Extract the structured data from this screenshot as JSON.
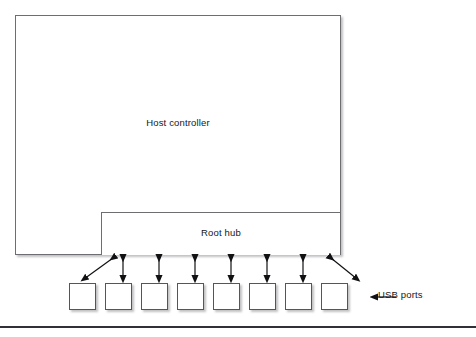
{
  "figure": {
    "type": "block-diagram",
    "background_color": "#ffffff",
    "line_color": "#6e6e72",
    "text_color": "#161616"
  },
  "blocks": {
    "host_controller": {
      "label": "Host controller",
      "x": 15,
      "y": 15,
      "width": 326,
      "height": 240
    },
    "root_hub": {
      "label": "Root hub",
      "x": 101,
      "y": 212,
      "width": 240,
      "height": 43
    }
  },
  "ports": {
    "count": 8,
    "callout_label": "USB ports",
    "callout_icon": "arrow-left-icon",
    "items": [
      {
        "index": 1,
        "label": ""
      },
      {
        "index": 2,
        "label": ""
      },
      {
        "index": 3,
        "label": ""
      },
      {
        "index": 4,
        "label": ""
      },
      {
        "index": 5,
        "label": ""
      },
      {
        "index": 6,
        "label": ""
      },
      {
        "index": 7,
        "label": ""
      },
      {
        "index": 8,
        "label": ""
      }
    ]
  },
  "connectors": {
    "style": "double-headed-arrow",
    "description": "Bidirectional arrows linking the root hub to each USB port",
    "count": 8,
    "diagonal_indices": [
      1,
      8
    ]
  },
  "caption": {
    "text": "",
    "clipped": true
  }
}
